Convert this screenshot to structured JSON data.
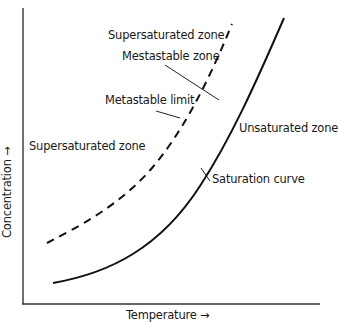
{
  "diagram": {
    "type": "solubility-supersaturation diagram",
    "x_axis_label": "Temperature →",
    "y_axis_label": "Concentration →",
    "zones": {
      "supersaturated_upper": "Supersaturated zone",
      "supersaturated_left": "Supersaturated zone",
      "metastable": "Mestastable zone",
      "unsaturated": "Unsaturated zone"
    },
    "curves": {
      "metastable_limit": {
        "label": "Metastable limit",
        "style": "dashed"
      },
      "saturation": {
        "label": "Saturation curve",
        "style": "solid"
      }
    },
    "colors": {
      "line": "#111111",
      "axis": "#333333",
      "text": "#1a1a1a",
      "background": "#ffffff"
    }
  }
}
